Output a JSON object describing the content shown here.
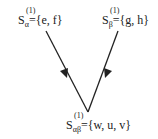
{
  "nodes": [
    {
      "id": "alpha",
      "symbol": "S",
      "superscript": "(1)",
      "subscript": "α",
      "set": "={e, f}"
    },
    {
      "id": "beta",
      "symbol": "S",
      "superscript": "(1)",
      "subscript": "β",
      "set": "={g, h}"
    },
    {
      "id": "alphabeta",
      "symbol": "S",
      "superscript": "(1)",
      "subscript": "αβ",
      "set": "={w, u, v}"
    }
  ],
  "edges": [
    {
      "from": "alpha",
      "to": "alphabeta"
    },
    {
      "from": "beta",
      "to": "alphabeta"
    }
  ]
}
